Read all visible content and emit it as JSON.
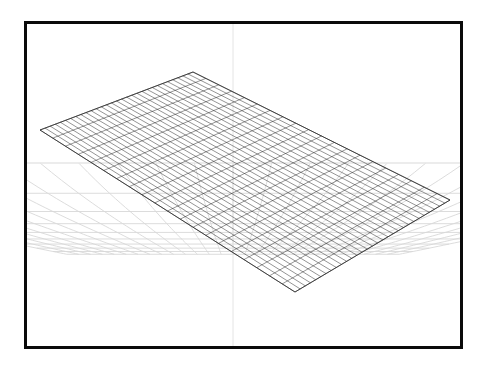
{
  "app": {
    "title": "3D Viewport",
    "view_label": "Perspective"
  },
  "viewport": {
    "name": "perspective-viewport",
    "background_color": "#ffffff",
    "frame_color": "#0a0a0a",
    "frame_thickness_px": 3,
    "frame_rect": {
      "x": 24,
      "y": 21,
      "width": 439,
      "height": 328
    }
  },
  "floor_grid": {
    "name": "ground-plane-grid",
    "color": "#d8d8d8",
    "line_width": 0.9,
    "horizon_color": "#ebebeb",
    "axis_color": "#e4e4e4",
    "horizon_y": 163,
    "axis_x": 233,
    "spacing_u": 1,
    "spacing_v": 1
  },
  "mesh": {
    "name": "subdivided-plane-mesh",
    "type": "wireframe-quad-grid",
    "wire_color": "#2b2b2b",
    "wire_width": 0.55,
    "fill_color": "#ffffff",
    "fill_opacity": 0.0,
    "subdivisions_u": 30,
    "subdivisions_v": 20,
    "corners": {
      "left": {
        "x": 40,
        "y": 130
      },
      "top": {
        "x": 193,
        "y": 72
      },
      "right": {
        "x": 450,
        "y": 200
      },
      "bottom": {
        "x": 295,
        "y": 292
      }
    }
  },
  "chart_data": {
    "type": "scatter",
    "xlabel": "U",
    "ylabel": "V",
    "grid": true,
    "legend": "none"
  }
}
